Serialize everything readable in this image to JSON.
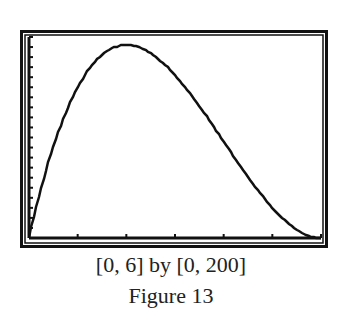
{
  "chart_data": {
    "type": "line",
    "title": "",
    "xlabel": "",
    "ylabel": "",
    "xlim": [
      0,
      6
    ],
    "ylim": [
      0,
      200
    ],
    "xticks": [
      0,
      1,
      2,
      3,
      4,
      5,
      6
    ],
    "ytick_step": 10,
    "grid": false,
    "legend": null,
    "series": [
      {
        "name": "y",
        "x": [
          0,
          0.25,
          0.5,
          0.75,
          1,
          1.25,
          1.5,
          1.75,
          2,
          2.25,
          2.5,
          2.75,
          3,
          3.25,
          3.5,
          3.75,
          4,
          4.25,
          4.5,
          4.75,
          5,
          5.25,
          5.5,
          5.75,
          6
        ],
        "values": [
          0,
          49.6,
          90.8,
          124.0,
          150.0,
          169.2,
          182.3,
          189.6,
          192.0,
          189.8,
          183.8,
          174.3,
          162.0,
          147.5,
          131.3,
          113.9,
          96.0,
          78.1,
          60.8,
          44.5,
          30.0,
          17.7,
          8.3,
          2.2,
          0
        ]
      }
    ],
    "caption_window": "[0, 6] by [0, 200]",
    "caption_figure": "Figure 13"
  },
  "captions": {
    "window": "[0, 6] by [0, 200]",
    "figure": "Figure 13"
  }
}
